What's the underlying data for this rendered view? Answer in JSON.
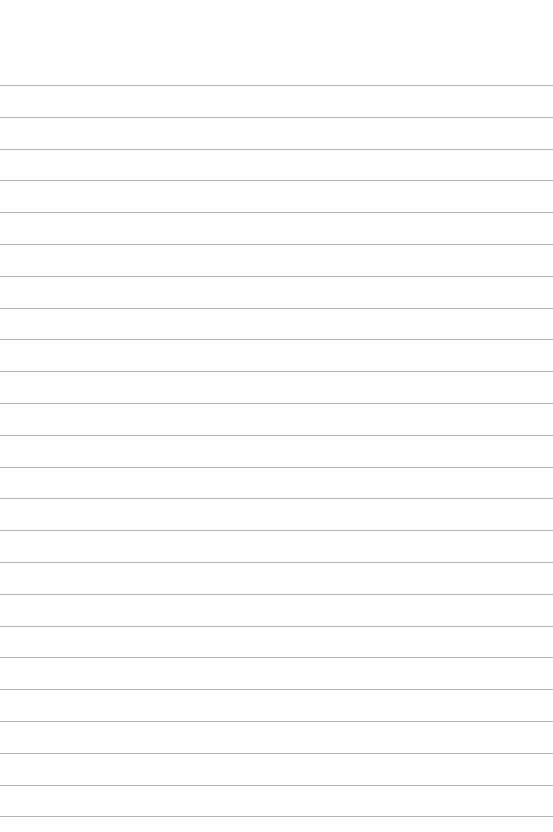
{
  "page": {
    "type": "lined-paper",
    "background": "#ffffff",
    "line_color": "#b4b4b4",
    "first_line_y": 85,
    "line_spacing": 31.8,
    "line_count": 24
  }
}
